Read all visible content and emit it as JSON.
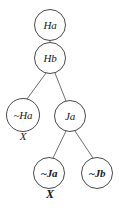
{
  "diagram": {
    "type": "tableau-tree",
    "background_color": "#ffffff",
    "node_stroke_color": "#4a4a4a",
    "text_color": "#1a1a1a",
    "nodes": [
      {
        "id": "n1",
        "label": "Ha",
        "bold": false,
        "cx": 50,
        "cy": 25,
        "r": 16
      },
      {
        "id": "n2",
        "label": "Hb",
        "bold": false,
        "cx": 50,
        "cy": 58,
        "r": 16
      },
      {
        "id": "n3",
        "label": "~Ha",
        "bold": false,
        "cx": 23,
        "cy": 115,
        "r": 17
      },
      {
        "id": "n4",
        "label": "Ja",
        "bold": false,
        "cx": 70,
        "cy": 116,
        "r": 16
      },
      {
        "id": "n5",
        "label": "~Ja",
        "bold": true,
        "cx": 49,
        "cy": 173,
        "r": 16
      },
      {
        "id": "n6",
        "label": "~Jb",
        "bold": true,
        "cx": 97,
        "cy": 173,
        "r": 16
      }
    ],
    "edges": [
      {
        "from": "n1",
        "to": "n2",
        "x1": 50,
        "y1": 41,
        "x2": 50,
        "y2": 42
      },
      {
        "from": "n2",
        "to": "n3",
        "x1": 46,
        "y1": 73,
        "x2": 27,
        "y2": 99
      },
      {
        "from": "n2",
        "to": "n4",
        "x1": 55,
        "y1": 73,
        "x2": 66,
        "y2": 101
      },
      {
        "from": "n4",
        "to": "n5",
        "x1": 66,
        "y1": 131,
        "x2": 53,
        "y2": 158
      },
      {
        "from": "n4",
        "to": "n6",
        "x1": 75,
        "y1": 131,
        "x2": 93,
        "y2": 158
      }
    ],
    "closure_marks": [
      {
        "id": "x1",
        "label": "X",
        "bold": false,
        "cx": 23,
        "cy": 137,
        "for_node": "n3"
      },
      {
        "id": "x2",
        "label": "X",
        "bold": true,
        "cx": 50,
        "cy": 194,
        "for_node": "n5"
      }
    ]
  }
}
